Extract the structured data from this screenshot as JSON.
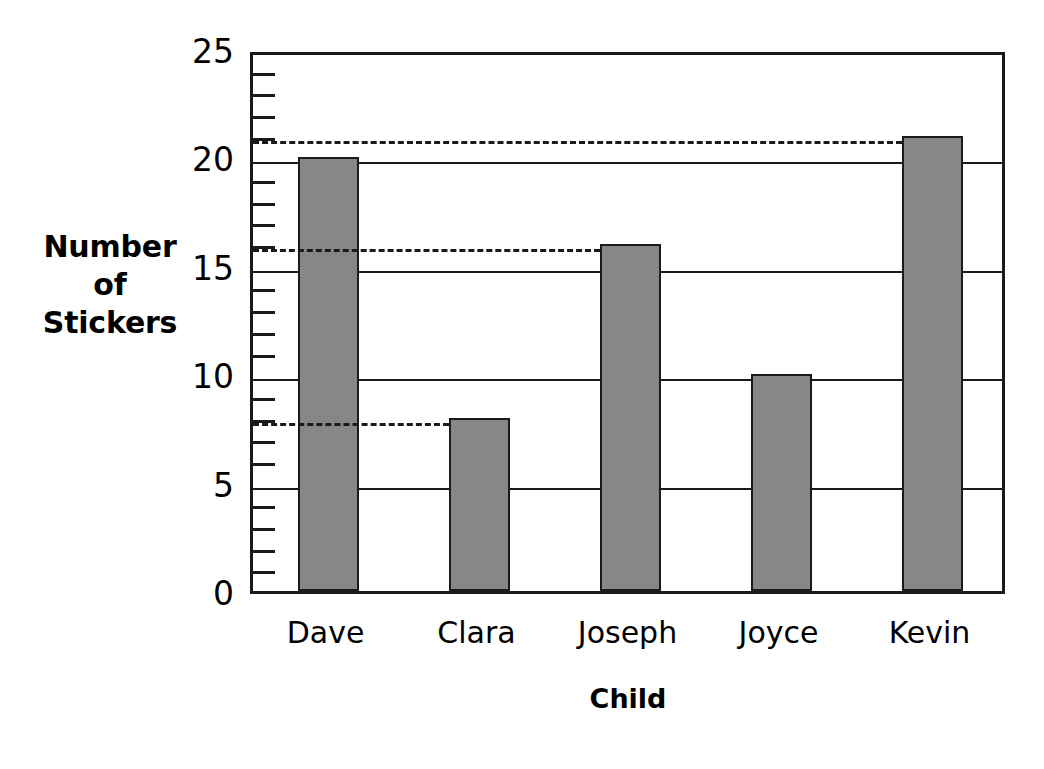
{
  "chart_data": {
    "type": "bar",
    "title": "",
    "xlabel": "Child",
    "ylabel": "Number of Stickers",
    "ylabel_lines": [
      "Number",
      "of",
      "Stickers"
    ],
    "categories": [
      "Dave",
      "Clara",
      "Joseph",
      "Joyce",
      "Kevin"
    ],
    "values": [
      20,
      8,
      16,
      10,
      21
    ],
    "ylim": [
      0,
      25
    ],
    "yticks": [
      0,
      5,
      10,
      15,
      20,
      25
    ],
    "ytick_labels": [
      "0",
      "5",
      "10",
      "15",
      "20",
      "25"
    ],
    "y_minor_tick_interval": 1,
    "gridlines": [
      5,
      10,
      15,
      20
    ],
    "grid": true,
    "legend": null,
    "bar_fill_color": "#878787",
    "bar_edge_color": "#1a1a1a",
    "axis_color": "#1a1a1a",
    "reference_lines": [
      {
        "value": 21,
        "style": "dashed",
        "extends_to_category": "Kevin"
      },
      {
        "value": 16,
        "style": "dashed",
        "extends_to_category": "Joseph"
      },
      {
        "value": 8,
        "style": "dashed",
        "extends_to_category": "Clara"
      }
    ],
    "annotations": []
  }
}
